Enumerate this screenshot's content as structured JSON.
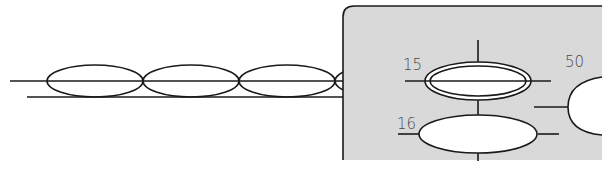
{
  "diagram": {
    "type": "stitch-diagram",
    "colors": {
      "background": "#ffffff",
      "panel_fill": "#d9d9d9",
      "stroke": "#1a1a1a",
      "label": "#4a4a4a",
      "stitch_fill": "#ffffff"
    },
    "chain": {
      "description": "row of chain stitch loops on two parallel lines",
      "loop_count": 3
    },
    "detail_panel": {
      "description": "magnified detail with numbered stitch callouts",
      "labels": {
        "stitch_15": "15",
        "stitch_16": "16",
        "stitch_50": "50"
      }
    }
  }
}
